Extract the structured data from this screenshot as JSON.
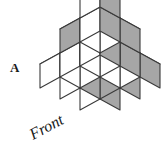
{
  "figure": {
    "label": "A",
    "front_label": "Front",
    "type": "isometric-cube-stack",
    "colors": {
      "outline": "#3a3a3a",
      "top_face": "#ffffff",
      "left_face": "#ffffff",
      "right_face_light": "#ffffff",
      "shaded_face": "#a6a6a6",
      "background": "#ffffff",
      "text": "#1a1a1a"
    },
    "geometry": {
      "cube_half_width": 20,
      "cube_half_depth": 11,
      "cube_height": 24,
      "origin_x": 100,
      "origin_y": 121
    },
    "cubes": [
      {
        "i": 0,
        "j": 0,
        "k": 0,
        "top": "white",
        "left": "white",
        "right": "gray"
      },
      {
        "i": 1,
        "j": 0,
        "k": 0,
        "top": "white",
        "left": "gray",
        "right": "gray"
      },
      {
        "i": 2,
        "j": 0,
        "k": 0,
        "top": "white",
        "left": "white",
        "right": "gray"
      },
      {
        "i": 0,
        "j": 1,
        "k": 0,
        "top": "white",
        "left": "white",
        "right": "gray"
      },
      {
        "i": 1,
        "j": 1,
        "k": 0,
        "top": "white",
        "left": "white",
        "right": "white"
      },
      {
        "i": 2,
        "j": 1,
        "k": 0,
        "top": "white",
        "left": "white",
        "right": "gray"
      },
      {
        "i": 0,
        "j": 2,
        "k": 0,
        "top": "white",
        "left": "white",
        "right": "white"
      },
      {
        "i": 1,
        "j": 2,
        "k": 0,
        "top": "white",
        "left": "white",
        "right": "white"
      },
      {
        "i": 2,
        "j": 2,
        "k": 0,
        "top": "white",
        "left": "white",
        "right": "gray"
      },
      {
        "i": 1,
        "j": 1,
        "k": 1,
        "top": "white",
        "left": "gray",
        "right": "white"
      },
      {
        "i": 2,
        "j": 1,
        "k": 1,
        "top": "white",
        "left": "white",
        "right": "gray"
      },
      {
        "i": 1,
        "j": 2,
        "k": 1,
        "top": "white",
        "left": "gray",
        "right": "white"
      },
      {
        "i": 2,
        "j": 2,
        "k": 1,
        "top": "white",
        "left": "white",
        "right": "gray"
      },
      {
        "i": 2,
        "j": 2,
        "k": 2,
        "top": "white",
        "left": "white",
        "right": "gray"
      }
    ],
    "front_label_rotation": -28
  }
}
